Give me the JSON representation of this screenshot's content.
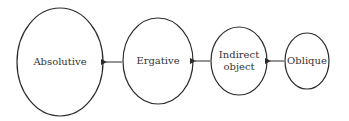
{
  "diagram": {
    "nodes": [
      {
        "id": "absolutive",
        "lines": [
          "Absolutive"
        ],
        "cx": 60,
        "cy": 62,
        "rx": 43,
        "ry": 54
      },
      {
        "id": "ergative",
        "lines": [
          "Ergative"
        ],
        "cx": 158,
        "cy": 61,
        "rx": 35,
        "ry": 43
      },
      {
        "id": "indirect-object",
        "lines": [
          "Indirect",
          "object"
        ],
        "cx": 239,
        "cy": 61,
        "rx": 28,
        "ry": 34
      },
      {
        "id": "oblique",
        "lines": [
          "Oblique"
        ],
        "cx": 307,
        "cy": 61,
        "rx": 22,
        "ry": 28
      }
    ],
    "edges": [
      {
        "from": "ergative",
        "to": "absolutive"
      },
      {
        "from": "indirect-object",
        "to": "ergative"
      },
      {
        "from": "oblique",
        "to": "indirect-object"
      }
    ],
    "colors": {
      "stroke": "#2b2b2b",
      "text": "#333333",
      "background": "#ffffff"
    }
  }
}
